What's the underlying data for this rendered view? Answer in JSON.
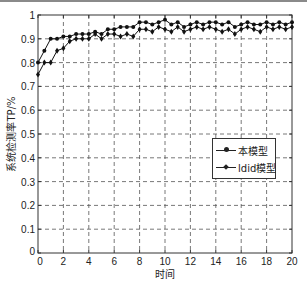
{
  "chart_data": {
    "type": "line",
    "title": "",
    "xlabel": "时间",
    "ylabel": "系统检测率TP/%",
    "xlim": [
      0,
      20
    ],
    "ylim": [
      0,
      1
    ],
    "grid": true,
    "legend_position": "center-right",
    "x_ticks": [
      "0",
      "2",
      "4",
      "6",
      "8",
      "10",
      "12",
      "14",
      "16",
      "18",
      "20"
    ],
    "y_ticks": [
      "0",
      "0.1",
      "0.2",
      "0.3",
      "0.4",
      "0.5",
      "0.6",
      "0.7",
      "0.8",
      "0.9",
      "1"
    ],
    "x": [
      0,
      0.5,
      1,
      1.5,
      2,
      2.5,
      3,
      3.5,
      4,
      4.5,
      5,
      5.5,
      6,
      6.5,
      7,
      7.5,
      8,
      8.5,
      9,
      9.5,
      10,
      10.5,
      11,
      11.5,
      12,
      12.5,
      13,
      13.5,
      14,
      14.5,
      15,
      15.5,
      16,
      16.5,
      17,
      17.5,
      18,
      18.5,
      19,
      19.5,
      20
    ],
    "series": [
      {
        "name": "本模型",
        "marker": "dot",
        "values": [
          0.8,
          0.85,
          0.9,
          0.9,
          0.91,
          0.91,
          0.92,
          0.92,
          0.92,
          0.93,
          0.92,
          0.94,
          0.94,
          0.95,
          0.95,
          0.95,
          0.97,
          0.97,
          0.96,
          0.97,
          0.98,
          0.96,
          0.97,
          0.95,
          0.96,
          0.97,
          0.96,
          0.97,
          0.97,
          0.96,
          0.97,
          0.95,
          0.96,
          0.97,
          0.96,
          0.96,
          0.97,
          0.96,
          0.97,
          0.96,
          0.97
        ]
      },
      {
        "name": "ldid模型",
        "marker": "diamond",
        "values": [
          0.75,
          0.8,
          0.8,
          0.85,
          0.86,
          0.89,
          0.9,
          0.9,
          0.9,
          0.92,
          0.9,
          0.92,
          0.92,
          0.91,
          0.92,
          0.91,
          0.94,
          0.94,
          0.93,
          0.95,
          0.94,
          0.93,
          0.95,
          0.93,
          0.94,
          0.95,
          0.94,
          0.95,
          0.94,
          0.93,
          0.94,
          0.92,
          0.94,
          0.95,
          0.94,
          0.93,
          0.95,
          0.94,
          0.95,
          0.94,
          0.95
        ]
      }
    ]
  },
  "legend": {
    "items": [
      {
        "label": "本模型"
      },
      {
        "label": "ldid模型"
      }
    ]
  }
}
